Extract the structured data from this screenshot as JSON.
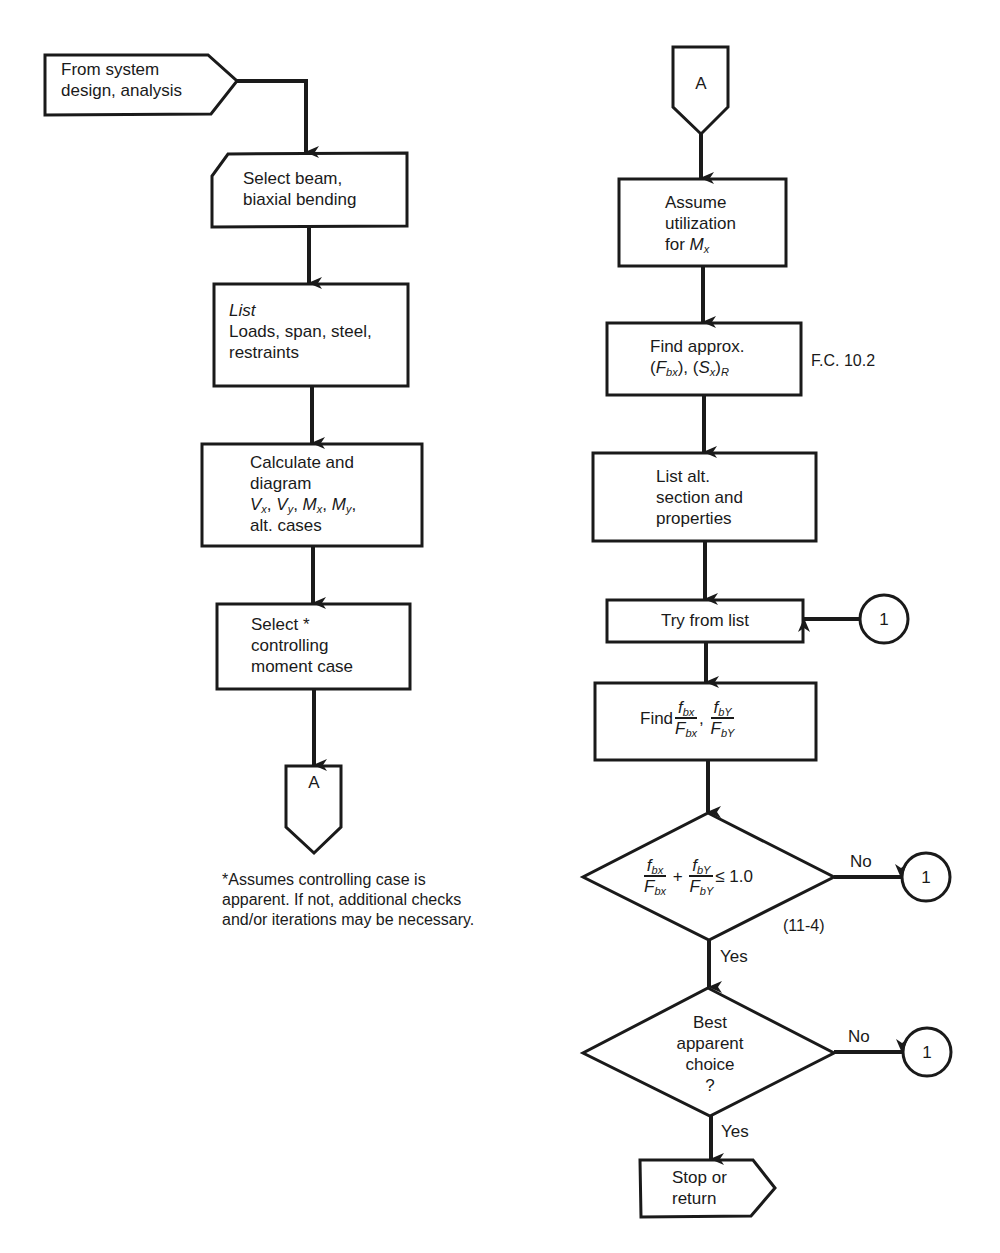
{
  "diagram": {
    "type": "flowchart",
    "left_column": {
      "start": {
        "line1": "From system",
        "line2": "design, analysis"
      },
      "select_beam": {
        "line1": "Select beam,",
        "line2": "biaxial bending"
      },
      "list_box": {
        "heading": "List",
        "line1": "Loads, span, steel,",
        "line2": "restraints"
      },
      "calculate_box": {
        "line1": "Calculate and",
        "line2": "diagram",
        "vx": "V",
        "vx_sub": "x",
        "vy": "V",
        "vy_sub": "y",
        "mx": "M",
        "mx_sub": "x",
        "my": "M",
        "my_sub": "y",
        "line4": "alt. cases"
      },
      "select_case": {
        "line1": "Select *",
        "line2": "controlling",
        "line3": "moment case"
      },
      "connector_out": "A",
      "footnote": {
        "line1": "*Assumes controlling case is",
        "line2": "apparent. If not, additional checks",
        "line3": "and/or iterations may be necessary."
      }
    },
    "right_column": {
      "connector_in": "A",
      "assume_box": {
        "line1": "Assume",
        "line2": "utilization",
        "line3_prefix": "for ",
        "var": "M",
        "var_sub": "x"
      },
      "find_approx": {
        "line1": "Find approx.",
        "f": "F",
        "f_sub": "bx",
        "s": "S",
        "s_sub": "x",
        "s_outer_sub": "R",
        "note": "F.C. 10.2"
      },
      "list_alt": {
        "line1": "List alt.",
        "line2": "section and",
        "line3": "properties"
      },
      "try_list": {
        "label": "Try from list",
        "connector": "1"
      },
      "find_ratios": {
        "prefix": "Find",
        "num1": "f",
        "num1_sub": "bx",
        "den1": "F",
        "den1_sub": "bx",
        "num2": "f",
        "num2_sub": "bY",
        "den2": "F",
        "den2_sub": "bY"
      },
      "decision_interaction": {
        "num1": "f",
        "num1_sub": "bx",
        "den1": "F",
        "den1_sub": "bx",
        "plus": "+",
        "num2": "f",
        "num2_sub": "bY",
        "den2": "F",
        "den2_sub": "bY",
        "relation": "≤ 1.0",
        "equation_ref": "(11-4)",
        "no_label": "No",
        "no_connector": "1",
        "yes_label": "Yes"
      },
      "decision_best": {
        "line1": "Best",
        "line2": "apparent",
        "line3": "choice",
        "line4": "?",
        "no_label": "No",
        "no_connector": "1",
        "yes_label": "Yes"
      },
      "end": {
        "line1": "Stop or",
        "line2": "return"
      }
    },
    "colors": {
      "stroke": "#1a1a1a",
      "background": "#ffffff"
    }
  }
}
